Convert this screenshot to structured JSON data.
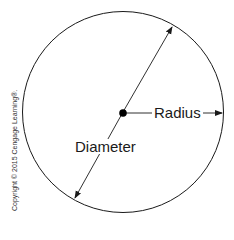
{
  "diagram": {
    "type": "circle-anatomy",
    "labels": {
      "radius": "Radius",
      "diameter": "Diameter"
    },
    "copyright": "Copyright © 2015 Cengage Learning®."
  },
  "colors": {
    "stroke": "#1a1a1a",
    "background": "#ffffff"
  }
}
